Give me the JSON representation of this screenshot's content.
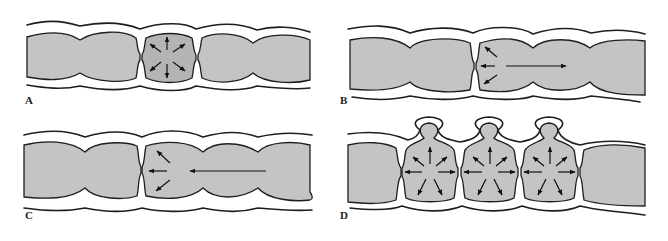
{
  "figure": {
    "width": 668,
    "height": 241,
    "colors": {
      "lumen": "#c4c4c4",
      "lumen_highlight": "#b4b4b4",
      "outline": "#1e1e1e",
      "arrow": "#111111",
      "background": "#ffffff"
    },
    "panels": [
      {
        "id": "A",
        "label": "A",
        "label_pos": [
          25,
          104
        ],
        "description": "Segment contraction with pressure radiating outward in all directions",
        "arrows_center": [
          167,
          57
        ],
        "radial_arrows": 8
      },
      {
        "id": "B",
        "label": "B",
        "label_pos": [
          340,
          104
        ],
        "description": "Contraction pushing contents forward (aboral propulsion)",
        "long_arrow": {
          "from": [
            506,
            66
          ],
          "to": [
            566,
            66
          ],
          "direction": "right"
        }
      },
      {
        "id": "C",
        "label": "C",
        "label_pos": [
          25,
          219
        ],
        "description": "Contents moving backward toward contraction",
        "long_arrow": {
          "from": [
            266,
            171
          ],
          "to": [
            190,
            171
          ],
          "direction": "left"
        }
      },
      {
        "id": "D",
        "label": "D",
        "label_pos": [
          340,
          219
        ],
        "description": "Segments with herniating diverticula-like outpouchings from high intraluminal pressure",
        "segment_centers": [
          [
            430,
            172
          ],
          [
            491,
            172
          ],
          [
            551,
            172
          ]
        ],
        "radial_arrows_per_segment": 8
      }
    ]
  }
}
